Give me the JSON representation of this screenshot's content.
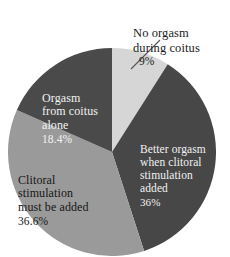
{
  "chart_data": {
    "type": "pie",
    "title": "",
    "categories": [
      "No orgasm during coitus",
      "Better orgasm when clitoral stimulation added",
      "Clitoral stimulation must be added",
      "Orgasm from coitus alone"
    ],
    "values": [
      9,
      36,
      36.6,
      18.4
    ],
    "value_labels": [
      "9%",
      "36%",
      "36.6%",
      "18.4%"
    ],
    "colors": [
      "#d6d6d6",
      "#474747",
      "#9a9a9a",
      "#4a4a4a"
    ],
    "start_angle_deg": 0,
    "direction": "clockwise",
    "legend": "none",
    "grid": false,
    "slices": [
      {
        "name": "No orgasm during coitus",
        "value": 9,
        "value_label": "9%",
        "color": "#d6d6d6",
        "label_lines": "No orgasm\nduring coitus",
        "label_color": "#1b1b1b",
        "label_placement": "outside-top-right",
        "has_leader_line": true
      },
      {
        "name": "Better orgasm when clitoral stimulation added",
        "value": 36,
        "value_label": "36%",
        "color": "#474747",
        "label_lines": "Better orgasm\nwhen clitoral\nstimulation\nadded",
        "label_color": "#f2f2f2",
        "label_placement": "inside-right",
        "has_leader_line": false
      },
      {
        "name": "Clitoral stimulation must be added",
        "value": 36.6,
        "value_label": "36.6%",
        "color": "#9a9a9a",
        "label_lines": "Clitoral\nstimulation\nmust be added",
        "label_color": "#161616",
        "label_placement": "inside-bottom-left",
        "has_leader_line": false
      },
      {
        "name": "Orgasm from coitus alone",
        "value": 18.4,
        "value_label": "18.4%",
        "color": "#4a4a4a",
        "label_lines": "Orgasm\nfrom coitus\nalone",
        "label_color": "#f2f2f2",
        "label_placement": "inside-top-left",
        "has_leader_line": false
      }
    ]
  },
  "labels": {
    "no_orgasm": {
      "text": "No orgasm\nduring coitus",
      "pct": "9%"
    },
    "better_orgasm": {
      "text": "Better orgasm\nwhen clitoral\nstimulation\nadded",
      "pct": "36%"
    },
    "clitoral_stimulation": {
      "text": "Clitoral\nstimulation\nmust be added",
      "pct": "36.6%"
    },
    "coitus_alone": {
      "text": "Orgasm\nfrom coitus\nalone",
      "pct": "18.4%"
    }
  },
  "style": {
    "background": "#ffffff",
    "leader_line_color": "#555555"
  }
}
